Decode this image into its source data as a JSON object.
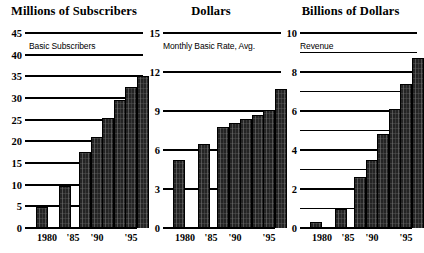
{
  "chart_data": [
    {
      "type": "bar",
      "title": "Millions of Subscribers",
      "series_label": "Basic Subscribers",
      "xlabel": "",
      "ylabel": "",
      "ylim": [
        0,
        45
      ],
      "yticks": [
        0,
        5,
        10,
        15,
        20,
        25,
        30,
        35,
        40,
        45
      ],
      "ytick_labels": [
        "0",
        "5",
        "10",
        "15",
        "20",
        "25",
        "30",
        "35",
        "40",
        "45"
      ],
      "grid": true,
      "legend": "none",
      "categories": [
        "1980",
        "1985",
        "1990",
        "1991",
        "1992",
        "1993",
        "1994",
        "1995"
      ],
      "x_axis_tick_labels": [
        "1980",
        "'85",
        "'90",
        "'95"
      ],
      "values": [
        4.8,
        9.7,
        17.5,
        21.0,
        25.5,
        29.5,
        32.5,
        35.0
      ]
    },
    {
      "type": "bar",
      "title": "Dollars",
      "series_label": "Monthly Basic Rate, Avg.",
      "xlabel": "",
      "ylabel": "",
      "ylim": [
        0,
        15
      ],
      "yticks": [
        0,
        3,
        6,
        9,
        12,
        15
      ],
      "ytick_labels": [
        "0",
        "3",
        "6",
        "9",
        "12",
        "15"
      ],
      "grid": true,
      "legend": "none",
      "categories": [
        "1980",
        "1985",
        "1990",
        "1991",
        "1992",
        "1993",
        "1994",
        "1995"
      ],
      "x_axis_tick_labels": [
        "1980",
        "'85",
        "'90",
        "'95"
      ],
      "values": [
        5.2,
        6.5,
        7.8,
        8.1,
        8.4,
        8.7,
        9.1,
        10.7
      ]
    },
    {
      "type": "bar",
      "title": "Billions of Dollars",
      "series_label": "Revenue",
      "xlabel": "",
      "ylabel": "",
      "ylim": [
        0,
        10
      ],
      "yticks": [
        0,
        2,
        4,
        6,
        8,
        10
      ],
      "ytick_labels": [
        "0",
        "2",
        "4",
        "6",
        "8",
        "10"
      ],
      "yminor": [
        1,
        3,
        5,
        7,
        9
      ],
      "grid": true,
      "legend": "none",
      "categories": [
        "1980",
        "1985",
        "1990",
        "1991",
        "1992",
        "1993",
        "1994",
        "1995"
      ],
      "x_axis_tick_labels": [
        "1980",
        "'85",
        "'90",
        "'95"
      ],
      "values": [
        0.3,
        1.0,
        2.6,
        3.5,
        4.8,
        6.1,
        7.4,
        8.7
      ]
    }
  ],
  "panels": [
    {
      "title": "Millions of Subscribers",
      "series_label": "Basic Subscribers",
      "ytick_labels": [
        "45",
        "40",
        "35",
        "30",
        "25",
        "20",
        "15",
        "10",
        "5",
        "0"
      ],
      "xtick_labels": [
        "1980",
        "'85",
        "'90",
        "'95"
      ]
    },
    {
      "title": "Dollars",
      "series_label": "Monthly Basic Rate, Avg.",
      "ytick_labels": [
        "15",
        "12",
        "9",
        "6",
        "3",
        "0"
      ],
      "xtick_labels": [
        "1980",
        "'85",
        "'90",
        "'95"
      ]
    },
    {
      "title": "Billions of Dollars",
      "series_label": "Revenue",
      "ytick_labels": [
        "10",
        "8",
        "6",
        "4",
        "2",
        "0"
      ],
      "xtick_labels": [
        "1980",
        "'85",
        "'90",
        "'95"
      ]
    }
  ],
  "colors": {
    "bar_fill": "#242424",
    "axis": "#000000",
    "background": "#ffffff"
  }
}
